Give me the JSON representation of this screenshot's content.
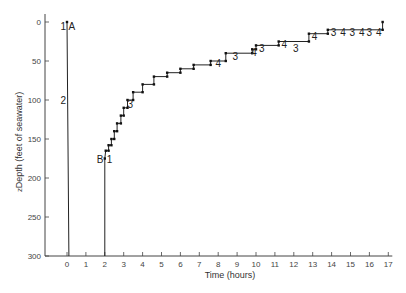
{
  "chart_data": {
    "type": "line",
    "title": "",
    "xlabel": "Time   (hours)",
    "ylabel": "Depth   (feet of seawater)",
    "ylabel_prefix": "z",
    "xlim": [
      -1,
      17
    ],
    "ylim": [
      300,
      0
    ],
    "y_inverted": true,
    "grid": false,
    "x_ticks": [
      0,
      1,
      2,
      3,
      4,
      5,
      6,
      7,
      8,
      9,
      10,
      11,
      12,
      13,
      14,
      15,
      16,
      17
    ],
    "y_ticks": [
      0,
      50,
      100,
      150,
      200,
      250,
      300
    ],
    "series": [
      {
        "name": "Dive A",
        "points": [
          [
            0,
            0
          ],
          [
            0.1,
            300
          ]
        ]
      },
      {
        "name": "Decompression B",
        "points": [
          [
            2.0,
            300
          ],
          [
            2.0,
            175
          ],
          [
            2.05,
            165
          ],
          [
            2.2,
            165
          ],
          [
            2.2,
            158
          ],
          [
            2.35,
            158
          ],
          [
            2.35,
            150
          ],
          [
            2.5,
            150
          ],
          [
            2.5,
            140
          ],
          [
            2.65,
            140
          ],
          [
            2.65,
            130
          ],
          [
            2.85,
            130
          ],
          [
            2.85,
            120
          ],
          [
            3.0,
            120
          ],
          [
            3.0,
            110
          ],
          [
            3.2,
            110
          ],
          [
            3.2,
            100
          ],
          [
            3.5,
            100
          ],
          [
            3.5,
            90
          ],
          [
            4.0,
            90
          ],
          [
            4.0,
            80
          ],
          [
            4.6,
            80
          ],
          [
            4.6,
            70
          ],
          [
            5.3,
            70
          ],
          [
            5.3,
            65
          ],
          [
            6.0,
            65
          ],
          [
            6.0,
            60
          ],
          [
            6.7,
            60
          ],
          [
            6.7,
            55
          ],
          [
            7.6,
            55
          ],
          [
            7.6,
            50
          ],
          [
            8.4,
            50
          ],
          [
            8.4,
            40
          ],
          [
            9.8,
            40
          ],
          [
            9.8,
            35
          ],
          [
            10.0,
            35
          ],
          [
            10.0,
            30
          ],
          [
            11.2,
            30
          ],
          [
            11.2,
            25
          ],
          [
            12.8,
            25
          ],
          [
            12.8,
            15
          ],
          [
            13.8,
            15
          ],
          [
            13.8,
            10
          ],
          [
            16.7,
            10
          ],
          [
            16.7,
            0
          ]
        ]
      }
    ],
    "annotations": [
      {
        "text": "1",
        "x": -0.2,
        "y": 5
      },
      {
        "text": "A",
        "x": 0.25,
        "y": 5
      },
      {
        "text": "2",
        "x": -0.2,
        "y": 100
      },
      {
        "text": "B",
        "x": 1.75,
        "y": 175
      },
      {
        "text": "1",
        "x": 2.25,
        "y": 175
      },
      {
        "text": "3",
        "x": 3.35,
        "y": 105
      },
      {
        "text": "3",
        "x": 8.9,
        "y": 43
      },
      {
        "text": "4",
        "x": 8.0,
        "y": 53
      },
      {
        "text": "4",
        "x": 9.9,
        "y": 38
      },
      {
        "text": "3",
        "x": 10.3,
        "y": 33
      },
      {
        "text": "4",
        "x": 11.5,
        "y": 28
      },
      {
        "text": "3",
        "x": 12.1,
        "y": 33
      },
      {
        "text": "4",
        "x": 13.1,
        "y": 18
      },
      {
        "text": "3",
        "x": 14.1,
        "y": 13
      },
      {
        "text": "4",
        "x": 14.6,
        "y": 13
      },
      {
        "text": "3",
        "x": 15.1,
        "y": 13
      },
      {
        "text": "4",
        "x": 15.6,
        "y": 13
      },
      {
        "text": "3",
        "x": 16.0,
        "y": 13
      },
      {
        "text": "4",
        "x": 16.5,
        "y": 13
      }
    ]
  }
}
